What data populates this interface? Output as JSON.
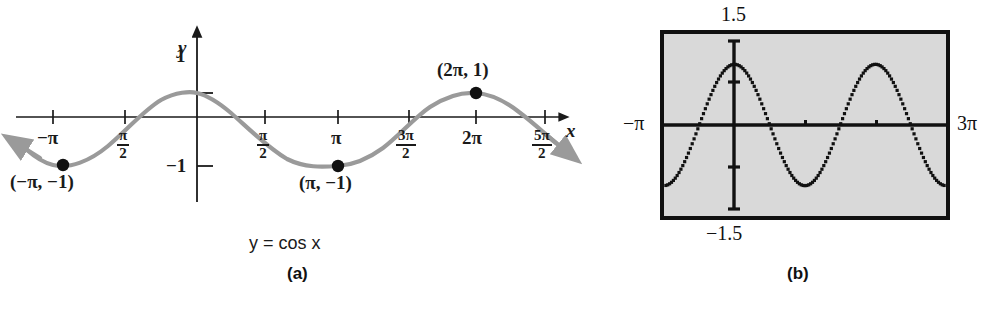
{
  "figure": {
    "panels": [
      {
        "id": "a",
        "caption": "(a)",
        "equation_y": "y",
        "equation_eq": "=",
        "equation_rhs": "cos x"
      },
      {
        "id": "b",
        "caption": "(b)"
      }
    ]
  },
  "panel_a": {
    "axis_label_x": "x",
    "axis_label_y": "y",
    "y_ticks": [
      {
        "label": "1",
        "value": 1
      },
      {
        "label": "−1",
        "value": -1
      }
    ],
    "x_ticks": [
      {
        "label": "−π",
        "kind": "plain",
        "value": -3.14159
      },
      {
        "label": "π/2",
        "numerator": "π",
        "denominator": "2",
        "kind": "fraction",
        "value": -1.5708
      },
      {
        "label": "π/2",
        "numerator": "π",
        "denominator": "2",
        "kind": "fraction",
        "value": 1.5708
      },
      {
        "label": "π",
        "kind": "plain",
        "value": 3.14159
      },
      {
        "label": "3π/2",
        "numerator": "3π",
        "denominator": "2",
        "kind": "fraction",
        "value": 4.71239
      },
      {
        "label": "2π",
        "kind": "plain",
        "value": 6.28319
      },
      {
        "label": "5π/2",
        "numerator": "5π",
        "denominator": "2",
        "kind": "fraction",
        "value": 7.85398
      }
    ],
    "marked_points": [
      {
        "label": "(−π, −1)",
        "x": -3.14159,
        "y": -1
      },
      {
        "label": "(π, −1)",
        "x": 3.14159,
        "y": -1
      },
      {
        "label": "(2π, 1)",
        "x": 6.28319,
        "y": 1
      }
    ],
    "equation": "y = cos x",
    "caption": "(a)"
  },
  "panel_b": {
    "screen_labels": {
      "top": "1.5",
      "bottom": "−1.5",
      "left": "−π",
      "right": "3π"
    },
    "caption": "(b)"
  },
  "colors": {
    "curve_gray": "#9a9a9a",
    "axis_black": "#1a1a1a",
    "point_black": "#111111",
    "screen_fill": "#d9d9d9",
    "screen_border": "#111111",
    "background": "#ffffff"
  },
  "chart_data": [
    {
      "type": "line",
      "id": "panel-a-cosine",
      "title": "y = cos x",
      "xlabel": "x",
      "ylabel": "y",
      "function": "y = cos(x)",
      "xlim": [
        -3.6652,
        8.1068
      ],
      "ylim": [
        -1.55,
        1.45
      ],
      "grid": false,
      "legend": "none",
      "xtick_labels": [
        "−π",
        "π/2",
        "π/2",
        "π",
        "3π/2",
        "2π",
        "5π/2"
      ],
      "xtick_values": [
        -3.14159,
        -1.5708,
        1.5708,
        3.14159,
        4.71239,
        6.28319,
        7.85398
      ],
      "ytick_labels": [
        "1",
        "−1"
      ],
      "ytick_values": [
        1,
        -1
      ],
      "annotations": [
        {
          "text": "(−π, −1)",
          "x": -3.14159,
          "y": -1
        },
        {
          "text": "(π, −1)",
          "x": 3.14159,
          "y": -1
        },
        {
          "text": "(2π, 1)",
          "x": 6.28319,
          "y": 1
        }
      ],
      "x": [
        -3.665,
        -3.4,
        -3.142,
        -2.8,
        -2.5,
        -2.2,
        -1.885,
        -1.571,
        -1.257,
        -0.942,
        -0.628,
        -0.314,
        0,
        0.314,
        0.628,
        0.942,
        1.257,
        1.571,
        1.885,
        2.2,
        2.5,
        2.8,
        3.142,
        3.456,
        3.77,
        4.084,
        4.398,
        4.712,
        5.027,
        5.341,
        5.655,
        5.969,
        6.283,
        6.597,
        6.912,
        7.226,
        7.54,
        7.854,
        8.107
      ],
      "y": [
        -0.866,
        -0.966,
        -1.0,
        -0.942,
        -0.801,
        -0.589,
        -0.309,
        0.0,
        0.309,
        0.589,
        0.809,
        0.951,
        1.0,
        0.951,
        0.809,
        0.589,
        0.309,
        0.0,
        -0.309,
        -0.589,
        -0.801,
        -0.942,
        -1.0,
        -0.951,
        -0.809,
        -0.589,
        -0.309,
        0.0,
        0.309,
        0.589,
        0.809,
        0.951,
        1.0,
        0.951,
        0.809,
        0.589,
        0.309,
        0.0,
        -0.259
      ]
    },
    {
      "type": "line",
      "id": "panel-b-calculator-view",
      "title": "(b)",
      "function": "y = cos(x)",
      "xlim": [
        -3.14159,
        9.42478
      ],
      "ylim": [
        -1.5,
        1.5
      ],
      "grid": false,
      "legend": "none",
      "xtick_labels": [
        "−π",
        "3π"
      ],
      "xtick_values": [
        -3.14159,
        9.42478
      ],
      "ytick_labels": [
        "1.5",
        "−1.5"
      ],
      "ytick_values": [
        1.5,
        -1.5
      ],
      "style": "dotted-pixel-trace"
    }
  ]
}
